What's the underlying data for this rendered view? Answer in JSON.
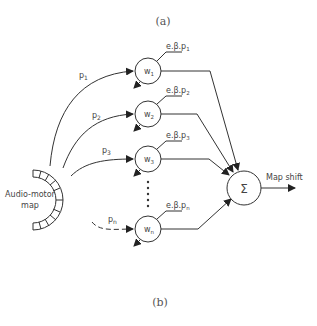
{
  "figure": {
    "caption_top": "(a)",
    "caption_bottom": "(b)"
  },
  "diagram": {
    "source": {
      "label_line1": "Audio-motor",
      "label_line2": "map"
    },
    "weights": [
      {
        "name": "w",
        "sub": "1",
        "input_label": "p",
        "input_sub": "1",
        "update_label": "e.β.p",
        "update_sub": "1",
        "dashed": false
      },
      {
        "name": "w",
        "sub": "2",
        "input_label": "p",
        "input_sub": "2",
        "update_label": "e.β.p",
        "update_sub": "2",
        "dashed": false
      },
      {
        "name": "w",
        "sub": "3",
        "input_label": "p",
        "input_sub": "3",
        "update_label": "e.β.p",
        "update_sub": "3",
        "dashed": false
      },
      {
        "name": "w",
        "sub": "n",
        "input_label": "p",
        "input_sub": "n",
        "update_label": "e.β.p",
        "update_sub": "n",
        "dashed": true
      }
    ],
    "ellipsis": "⋮",
    "sum_node": {
      "symbol": "Σ"
    },
    "output": {
      "label": "Map shift"
    }
  }
}
